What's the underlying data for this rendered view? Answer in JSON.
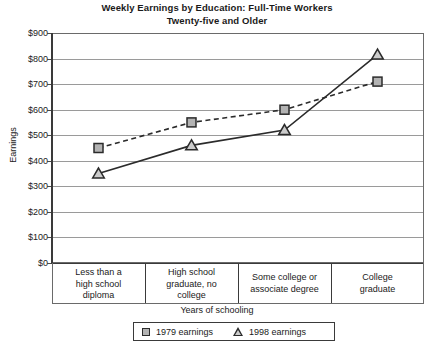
{
  "chart_data": {
    "type": "line",
    "title": "Weekly Earnings by Education: Full-Time Workers Twenty-five and Older",
    "title_line1": "Weekly Earnings by Education: Full-Time Workers",
    "title_line2": "Twenty-five and Older",
    "xlabel": "Years of schooling",
    "ylabel": "Earnings",
    "ylim": [
      0,
      900
    ],
    "grid": true,
    "legend_position": "bottom",
    "categories": [
      "Less than a high school diploma",
      "High school graduate, no college",
      "Some college or associate degree",
      "College graduate"
    ],
    "category_lines": [
      [
        "Less than a",
        "high school",
        "diploma"
      ],
      [
        "High school",
        "graduate, no",
        "college"
      ],
      [
        "Some college or",
        "associate degree"
      ],
      [
        "College",
        "graduate"
      ]
    ],
    "ytick_labels": [
      "$900",
      "$800",
      "$700",
      "$600",
      "$500",
      "$400",
      "$300",
      "$200",
      "$100",
      "$0"
    ],
    "ytick_values": [
      900,
      800,
      700,
      600,
      500,
      400,
      300,
      200,
      100,
      0
    ],
    "series": [
      {
        "name": "1979 earnings",
        "marker": "square",
        "line_style": "dashed",
        "color": "#2b2b2b",
        "marker_fill": "#b3b3b3",
        "values": [
          450,
          550,
          600,
          710
        ]
      },
      {
        "name": "1998 earnings",
        "marker": "triangle",
        "line_style": "solid",
        "color": "#2b2b2b",
        "marker_fill": "#cccccc",
        "values": [
          350,
          460,
          520,
          815
        ]
      }
    ]
  },
  "legend": {
    "items": [
      {
        "label": "1979 earnings",
        "marker": "square-marker"
      },
      {
        "label": "1998 earnings",
        "marker": "triangle-marker"
      }
    ]
  }
}
